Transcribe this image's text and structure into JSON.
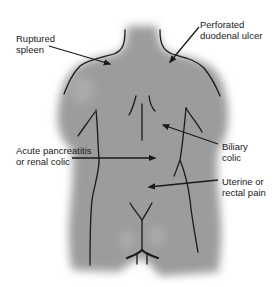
{
  "diagram": {
    "colors": {
      "body_fill": "#9a9a9a",
      "outline": "#1a1a1a",
      "text": "#1a1a1a",
      "background": "#ffffff"
    },
    "labels": [
      {
        "id": "ruptured-spleen",
        "lines": [
          "Ruptured",
          "spleen"
        ]
      },
      {
        "id": "perforated-duodenal-ulcer",
        "lines": [
          "Perforated",
          "duodenal ulcer"
        ]
      },
      {
        "id": "biliary-colic",
        "lines": [
          "Biliary",
          "colic"
        ]
      },
      {
        "id": "acute-pancreatitis-renal-colic",
        "lines": [
          "Acute pancreatitis",
          "or renal colic"
        ]
      },
      {
        "id": "uterine-rectal-pain",
        "lines": [
          "Uterine or",
          "rectal pain"
        ]
      }
    ]
  }
}
